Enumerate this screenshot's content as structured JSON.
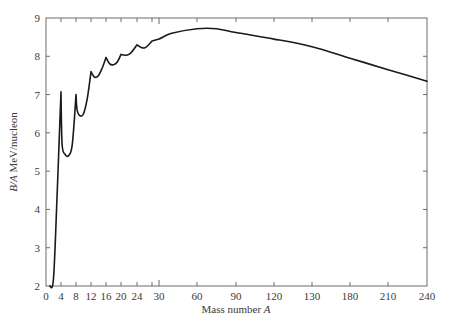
{
  "chart_data": {
    "type": "line",
    "title": "",
    "xlabel": "Mass number A",
    "xlabel_plain": "Mass number ",
    "xlabel_italic": "A",
    "ylabel": "B/A MeV/nucleon",
    "ylabel_italic": "B/A",
    "ylabel_plain": " MeV/nucleon",
    "ylim": [
      2,
      9
    ],
    "xlim": [
      0,
      240
    ],
    "grid": false,
    "legend": null,
    "x_scale_note": "non-linear: 0-30 expanded, 30-240 compressed",
    "x_ticks": [
      {
        "label": "0",
        "px": 46
      },
      {
        "label": "4",
        "px": 61
      },
      {
        "label": "8",
        "px": 76
      },
      {
        "label": "12",
        "px": 91
      },
      {
        "label": "16",
        "px": 106
      },
      {
        "label": "20",
        "px": 121
      },
      {
        "label": "24",
        "px": 137
      },
      {
        "label": "",
        "px": 152
      },
      {
        "label": "30",
        "px": 159
      },
      {
        "label": "60",
        "px": 197
      },
      {
        "label": "90",
        "px": 236
      },
      {
        "label": "120",
        "px": 274
      },
      {
        "label": "130",
        "px": 312
      },
      {
        "label": "180",
        "px": 350
      },
      {
        "label": "210",
        "px": 388
      },
      {
        "label": "240",
        "px": 427
      }
    ],
    "y_ticks": [
      "2",
      "3",
      "4",
      "5",
      "6",
      "7",
      "8",
      "9"
    ],
    "series": [
      {
        "name": "Binding energy per nucleon",
        "points": [
          {
            "A": 1,
            "BA": 2.0
          },
          {
            "A": 2,
            "BA": 2.2
          },
          {
            "A": 3,
            "BA": 4.5
          },
          {
            "A": 4,
            "BA": 7.07
          },
          {
            "A": 4.3,
            "BA": 5.7
          },
          {
            "A": 5,
            "BA": 5.45
          },
          {
            "A": 6,
            "BA": 5.4
          },
          {
            "A": 7,
            "BA": 5.7
          },
          {
            "A": 8,
            "BA": 7.0
          },
          {
            "A": 8.3,
            "BA": 6.6
          },
          {
            "A": 9,
            "BA": 6.45
          },
          {
            "A": 10,
            "BA": 6.5
          },
          {
            "A": 11,
            "BA": 6.9
          },
          {
            "A": 12,
            "BA": 7.6
          },
          {
            "A": 13,
            "BA": 7.45
          },
          {
            "A": 14,
            "BA": 7.5
          },
          {
            "A": 15,
            "BA": 7.7
          },
          {
            "A": 16,
            "BA": 7.97
          },
          {
            "A": 17,
            "BA": 7.8
          },
          {
            "A": 18,
            "BA": 7.78
          },
          {
            "A": 19,
            "BA": 7.85
          },
          {
            "A": 20,
            "BA": 8.05
          },
          {
            "A": 22,
            "BA": 8.05
          },
          {
            "A": 24,
            "BA": 8.3
          },
          {
            "A": 26,
            "BA": 8.22
          },
          {
            "A": 28,
            "BA": 8.4
          },
          {
            "A": 30,
            "BA": 8.45
          },
          {
            "A": 40,
            "BA": 8.6
          },
          {
            "A": 60,
            "BA": 8.72
          },
          {
            "A": 75,
            "BA": 8.72
          },
          {
            "A": 90,
            "BA": 8.62
          },
          {
            "A": 120,
            "BA": 8.45
          },
          {
            "A": 130,
            "BA": 8.25
          },
          {
            "A": 180,
            "BA": 7.95
          },
          {
            "A": 210,
            "BA": 7.65
          },
          {
            "A": 240,
            "BA": 7.35
          }
        ]
      }
    ]
  }
}
